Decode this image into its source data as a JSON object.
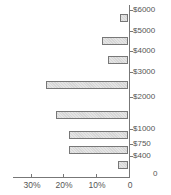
{
  "chart_data": {
    "type": "bar",
    "orientation": "horizontal",
    "direction": "right-to-left",
    "title": "",
    "xlabel": "",
    "ylabel": "",
    "categories": [
      "$6000+",
      "$5000",
      "$4000",
      "$3000",
      "$2000",
      "$1000",
      "$750",
      "$400"
    ],
    "values": [
      2.5,
      8,
      6,
      25,
      22,
      18,
      18,
      3
    ],
    "xlim": [
      0,
      35
    ],
    "x_ticks": [
      "30%",
      "20%",
      "10%",
      "0"
    ],
    "y_ticks": [
      "$6000",
      "$5000",
      "$4000",
      "$3000",
      "$2000",
      "$1000",
      "$750",
      "$400",
      "0"
    ],
    "grid": false,
    "legend": null,
    "bar_color": "#d6d6d6",
    "bar_edge_color": "#777777"
  },
  "y_labels": [
    {
      "text": "$6000",
      "y": 10
    },
    {
      "text": "$5000",
      "y": 31
    },
    {
      "text": "$4000",
      "y": 51
    },
    {
      "text": "$3000",
      "y": 72
    },
    {
      "text": "$2000",
      "y": 97
    },
    {
      "text": "$1000",
      "y": 129
    },
    {
      "text": "$750",
      "y": 144
    },
    {
      "text": "$400",
      "y": 156
    },
    {
      "text": "0",
      "y": 174
    }
  ],
  "x_labels": [
    {
      "text": "30%",
      "x": 31
    },
    {
      "text": "20%",
      "x": 63
    },
    {
      "text": "10%",
      "x": 96
    },
    {
      "text": "0",
      "x": 129
    }
  ],
  "bars": [
    {
      "value": 2.5,
      "top": 14
    },
    {
      "value": 8,
      "top": 37
    },
    {
      "value": 6,
      "top": 56
    },
    {
      "value": 25,
      "top": 81
    },
    {
      "value": 22,
      "top": 111
    },
    {
      "value": 18,
      "top": 131
    },
    {
      "value": 18,
      "top": 146
    },
    {
      "value": 3,
      "top": 161
    }
  ]
}
